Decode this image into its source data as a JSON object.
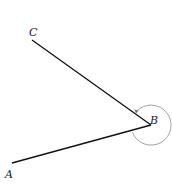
{
  "diagram": {
    "points": {
      "A": {
        "label": "A",
        "x": 12,
        "y": 163
      },
      "B": {
        "label": "B",
        "x": 151,
        "y": 125
      },
      "C": {
        "label": "C",
        "x": 32,
        "y": 40
      }
    },
    "segments": [
      [
        "B",
        "C"
      ],
      [
        "B",
        "A"
      ]
    ],
    "angle_arc": {
      "vertex": "B",
      "radius": 20,
      "type": "reflex",
      "color": "#999999"
    },
    "line_color": "#111111"
  }
}
